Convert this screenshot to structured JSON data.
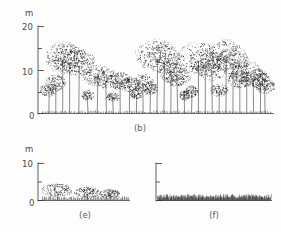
{
  "figure": {
    "background_color": "#fdfdfd",
    "ink_color": "#2e2e2e",
    "unit_label": "m",
    "panels": [
      {
        "id": "b",
        "caption": "(b)",
        "axis": {
          "unit": "m",
          "ticks": [
            0,
            10,
            20
          ],
          "minor_ticks": [
            5,
            15
          ],
          "min": 0,
          "max": 20
        },
        "vegetation_type": "tall closed forest",
        "description": "dense stand of slender trees with stippled crowns"
      },
      {
        "id": "e",
        "caption": "(e)",
        "axis": {
          "unit": "m",
          "ticks": [
            0,
            10
          ],
          "minor_ticks": [
            5
          ],
          "min": 0,
          "max": 10
        },
        "vegetation_type": "shrubland over grass",
        "description": "three scattered low shrubs above a continuous grass layer"
      },
      {
        "id": "f",
        "caption": "(f)",
        "axis": {
          "unit": "",
          "ticks": [],
          "minor_ticks": [],
          "min": 0,
          "max": 10
        },
        "vegetation_type": "grassland",
        "description": "continuous dense herb and grass layer, no woody plants"
      }
    ]
  },
  "chart_data": {
    "type": "scatter",
    "title": "",
    "subtitle": "",
    "xlabel": "",
    "ylabel": "m",
    "grid": false,
    "legend": "none",
    "panels": [
      {
        "panel": "b",
        "caption": "(b)",
        "ylabel": "m",
        "ylim": [
          0,
          20
        ],
        "yticks": [
          0,
          10,
          20
        ],
        "yminorticks": [
          5,
          15
        ],
        "series": [
          {
            "name": "tree heights",
            "units": "m",
            "x": [
              3,
              6,
              9,
              12,
              16,
              20,
              24,
              28,
              31,
              34,
              38,
              41,
              44,
              47,
              50,
              53,
              56,
              59,
              62,
              65,
              68,
              71,
              74,
              77,
              80,
              83,
              86,
              89,
              92,
              95,
              97
            ],
            "values": [
              6.5,
              8.5,
              15.5,
              15.0,
              14.0,
              5.0,
              10.5,
              9.5,
              4.5,
              9.0,
              8.0,
              5.5,
              8.5,
              7.0,
              16.0,
              15.0,
              11.5,
              10.0,
              5.0,
              6.0,
              15.5,
              14.0,
              12.5,
              6.5,
              16.0,
              14.5,
              9.5,
              11.5,
              10.0,
              9.0,
              7.5
            ]
          }
        ]
      },
      {
        "panel": "e",
        "caption": "(e)",
        "ylabel": "m",
        "ylim": [
          0,
          10
        ],
        "yticks": [
          0,
          10
        ],
        "yminorticks": [
          5
        ],
        "series": [
          {
            "name": "shrub heights",
            "units": "m",
            "x": [
              18,
              52,
              78
            ],
            "values": [
              4.2,
              3.4,
              2.8
            ]
          },
          {
            "name": "grass layer height",
            "units": "m",
            "x": [
              0,
              100
            ],
            "values": [
              1.2,
              1.2
            ]
          }
        ]
      },
      {
        "panel": "f",
        "caption": "(f)",
        "ylabel": "",
        "ylim": [
          0,
          10
        ],
        "yticks": [],
        "yminorticks": [],
        "series": [
          {
            "name": "grass layer height",
            "units": "m",
            "x": [
              0,
              100
            ],
            "values": [
              1.8,
              1.8
            ]
          }
        ]
      }
    ]
  }
}
